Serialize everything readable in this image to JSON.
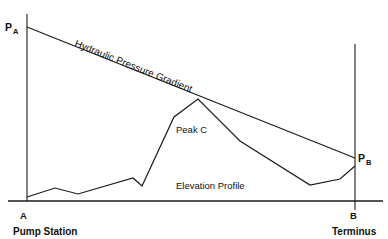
{
  "figure": {
    "title_internal": "Hydraulic Pressure Gradient and Elevation Profile",
    "background_color": "#ffffff",
    "line_color": "#1a1a1a",
    "text_color": "#111111"
  },
  "labels": {
    "pressure_a": "P",
    "pressure_a_sub": "A",
    "pressure_b": "P",
    "pressure_b_sub": "B",
    "node_a": "A",
    "node_b": "B",
    "station_a": "Pump Station",
    "station_b": "Terminus",
    "gradient_label": "Hydraulic Pressure Gradient",
    "peak_label": "Peak C",
    "elevation_label": "Elevation Profile"
  },
  "chart_data": {
    "type": "line",
    "xlabel": "",
    "ylabel": "",
    "grid": false,
    "legend_position": "inline-annotations",
    "axes": {
      "left_axis": {
        "x": 27,
        "y_top": 14,
        "y_bottom": 201
      },
      "right_axis": {
        "x": 355,
        "y_top": 44,
        "y_bottom": 210
      },
      "baseline": {
        "y": 201,
        "x_start": 8,
        "x_end": 383
      }
    },
    "series": [
      {
        "name": "Hydraulic Pressure Gradient",
        "kind": "straight-line",
        "points": [
          {
            "x": 27,
            "y": 27
          },
          {
            "x": 355,
            "y": 158
          }
        ]
      },
      {
        "name": "Elevation Profile",
        "kind": "polyline",
        "points": [
          {
            "x": 27,
            "y": 197
          },
          {
            "x": 55,
            "y": 188
          },
          {
            "x": 78,
            "y": 194
          },
          {
            "x": 133,
            "y": 178
          },
          {
            "x": 142,
            "y": 186
          },
          {
            "x": 174,
            "y": 117
          },
          {
            "x": 198,
            "y": 99
          },
          {
            "x": 240,
            "y": 141
          },
          {
            "x": 310,
            "y": 185
          },
          {
            "x": 340,
            "y": 179
          },
          {
            "x": 355,
            "y": 166
          }
        ]
      }
    ],
    "annotations": [
      {
        "text": "Hydraulic Pressure Gradient",
        "x": 74,
        "y": 44,
        "rotation": 21.8
      },
      {
        "text": "Peak C",
        "x": 176,
        "y": 130,
        "rotation": 0
      },
      {
        "text": "Elevation Profile",
        "x": 176,
        "y": 186,
        "rotation": 0
      },
      {
        "text": "P",
        "x": 7,
        "y": 30,
        "rotation": 0
      },
      {
        "text": "P",
        "x": 359,
        "y": 161,
        "rotation": 0
      },
      {
        "text": "A",
        "x": 22,
        "y": 218,
        "rotation": 0
      },
      {
        "text": "B",
        "x": 351,
        "y": 218,
        "rotation": 0
      },
      {
        "text": "Pump Station",
        "x": 14,
        "y": 234,
        "rotation": 0
      },
      {
        "text": "Terminus",
        "x": 334,
        "y": 234,
        "rotation": 0
      }
    ]
  }
}
